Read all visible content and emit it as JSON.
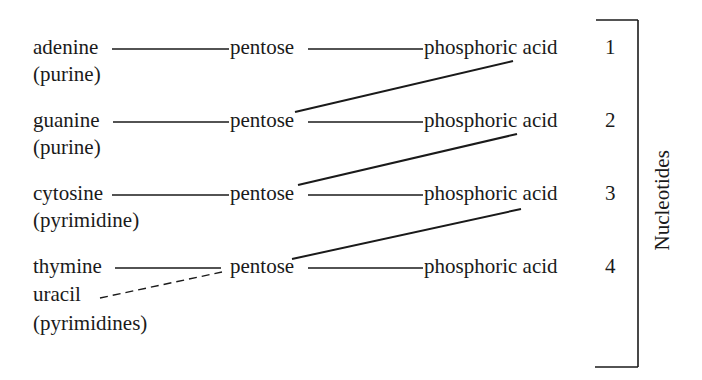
{
  "diagram": {
    "rows": [
      {
        "base": "adenine",
        "class": "(purine)",
        "sugar": "pentose",
        "acid": "phosphoric acid",
        "number": "1"
      },
      {
        "base": "guanine",
        "class": "(purine)",
        "sugar": "pentose",
        "acid": "phosphoric acid",
        "number": "2"
      },
      {
        "base": "cytosine",
        "class": "(pyrimidine)",
        "sugar": "pentose",
        "acid": "phosphoric acid",
        "number": "3"
      },
      {
        "base": "thymine",
        "alt_base": "uracil",
        "class": "(pyrimidines)",
        "sugar": "pentose",
        "acid": "phosphoric acid",
        "number": "4"
      }
    ],
    "bracket_label": "Nucleotides",
    "line_color": "#1a1a1a"
  }
}
